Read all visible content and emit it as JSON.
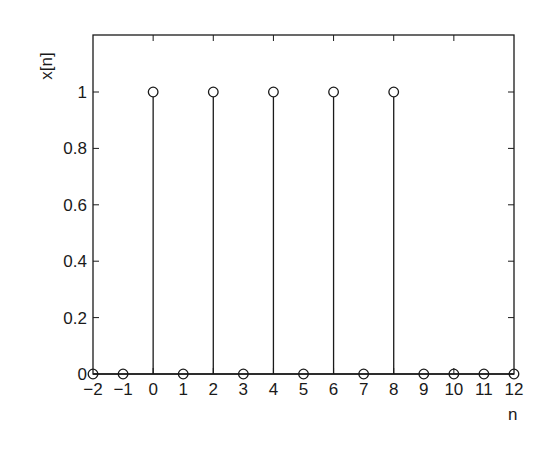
{
  "chart_data": {
    "type": "stem",
    "title": "",
    "xlabel": "n",
    "ylabel": "x[n]",
    "xlim": [
      -2,
      12
    ],
    "ylim": [
      0,
      1.2
    ],
    "x": [
      -2,
      -1,
      0,
      1,
      2,
      3,
      4,
      5,
      6,
      7,
      8,
      9,
      10,
      11,
      12
    ],
    "values": [
      0,
      0,
      1,
      0,
      1,
      0,
      1,
      0,
      1,
      0,
      1,
      0,
      0,
      0,
      0
    ],
    "xticks": [
      -2,
      -1,
      0,
      1,
      2,
      3,
      4,
      5,
      6,
      7,
      8,
      9,
      10,
      11,
      12
    ],
    "xtick_labels": [
      "−2",
      "−1",
      "0",
      "1",
      "2",
      "3",
      "4",
      "5",
      "6",
      "7",
      "8",
      "9",
      "10",
      "11",
      "12"
    ],
    "xtick_marks": [
      0,
      2,
      4,
      6,
      8,
      10
    ],
    "yticks": [
      0,
      0.2,
      0.4,
      0.6,
      0.8,
      1
    ],
    "ytick_labels": [
      "0",
      "0.2",
      "0.4",
      "0.6",
      "0.8",
      "1"
    ],
    "grid": false,
    "marker": "open-circle",
    "line_color": "#1a1a1a",
    "background": "#ffffff"
  }
}
